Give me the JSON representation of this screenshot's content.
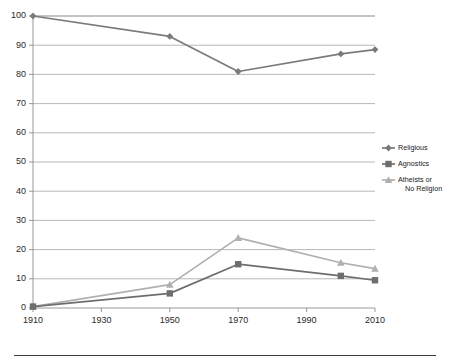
{
  "chart_data": {
    "type": "line",
    "title": "",
    "xlabel": "Year",
    "ylabel": "",
    "x": [
      1910,
      1950,
      1970,
      2000,
      2010
    ],
    "xticks": [
      1910,
      1930,
      1950,
      1970,
      1990,
      2010
    ],
    "yticks": [
      0,
      10,
      20,
      30,
      40,
      50,
      60,
      70,
      80,
      90,
      100
    ],
    "xlim": [
      1910,
      2010
    ],
    "ylim": [
      0,
      100
    ],
    "grid": "horizontal",
    "legend_position": "right",
    "series": [
      {
        "name": "Religious",
        "marker": "diamond",
        "color": "#7a7a7a",
        "values": [
          100,
          93,
          81,
          87,
          88.5
        ]
      },
      {
        "name": "Agnostics",
        "marker": "square",
        "color": "#6e6e6e",
        "values": [
          0.5,
          5,
          15,
          11,
          9.5
        ]
      },
      {
        "name": "Atheists or No Religion",
        "marker": "triangle",
        "color": "#b0b0b0",
        "values": [
          0.5,
          8,
          24,
          15.5,
          13.5
        ]
      }
    ]
  },
  "axes": {
    "x_title": "Year",
    "x_tick_labels": [
      "1910",
      "1930",
      "1950",
      "1970",
      "1990",
      "2010"
    ],
    "y_tick_labels": [
      "0",
      "10",
      "20",
      "30",
      "40",
      "50",
      "60",
      "70",
      "80",
      "90",
      "100"
    ]
  },
  "legend": {
    "items": [
      {
        "label": "Religious"
      },
      {
        "label": "Agnostics"
      },
      {
        "label_line1": "Atheists or",
        "label_line2": "No Religion"
      }
    ]
  }
}
